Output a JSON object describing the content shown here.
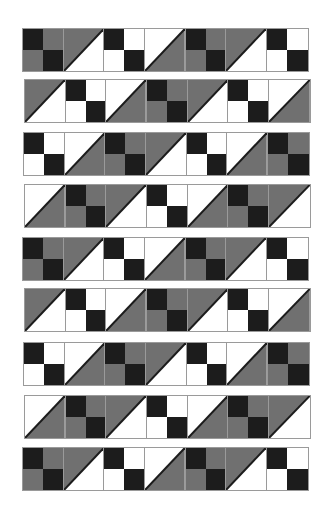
{
  "colors": {
    "black": "#1c1c1c",
    "gray": "#707070",
    "white": "#ffffff",
    "seam": "#9a9a9a"
  },
  "block_types": {
    "A": {
      "kind": "four-patch",
      "cells": [
        "black",
        "gray",
        "gray",
        "black"
      ]
    },
    "B": {
      "kind": "four-patch",
      "cells": [
        "black",
        "white",
        "white",
        "black"
      ]
    },
    "T1": {
      "kind": "half-square-triangle",
      "upper_left": "gray",
      "lower_right": "white"
    },
    "T2": {
      "kind": "half-square-triangle",
      "upper_left": "white",
      "lower_right": "gray"
    }
  },
  "rows": [
    {
      "x": 22,
      "y": 28,
      "blocks": [
        "A",
        "T1",
        "B",
        "T2",
        "A",
        "T1",
        "B"
      ]
    },
    {
      "x": 24,
      "y": 79,
      "blocks": [
        "T1",
        "B",
        "T2",
        "A",
        "T1",
        "B",
        "T2"
      ]
    },
    {
      "x": 23,
      "y": 132,
      "blocks": [
        "B",
        "T2",
        "A",
        "T1",
        "B",
        "T2",
        "A"
      ]
    },
    {
      "x": 24,
      "y": 184,
      "blocks": [
        "T2",
        "A",
        "T1",
        "B",
        "T2",
        "A",
        "T1"
      ]
    },
    {
      "x": 22,
      "y": 237,
      "blocks": [
        "A",
        "T1",
        "B",
        "T2",
        "A",
        "T1",
        "B"
      ]
    },
    {
      "x": 24,
      "y": 288,
      "blocks": [
        "T1",
        "B",
        "T2",
        "A",
        "T1",
        "B",
        "T2"
      ]
    },
    {
      "x": 23,
      "y": 342,
      "blocks": [
        "B",
        "T2",
        "A",
        "T1",
        "B",
        "T2",
        "A"
      ]
    },
    {
      "x": 24,
      "y": 395,
      "blocks": [
        "T2",
        "A",
        "T1",
        "B",
        "T2",
        "A",
        "T1"
      ]
    },
    {
      "x": 22,
      "y": 447,
      "blocks": [
        "A",
        "T1",
        "B",
        "T2",
        "A",
        "T1",
        "B"
      ]
    }
  ]
}
